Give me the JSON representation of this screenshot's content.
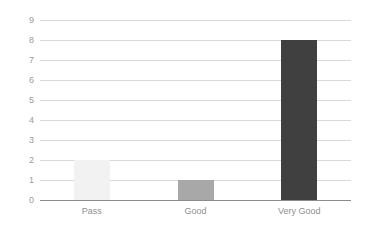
{
  "chart_data": {
    "type": "bar",
    "title": "",
    "subtitle": "",
    "xlabel": "",
    "ylabel": "",
    "categories": [
      "Pass",
      "Good",
      "Very Good"
    ],
    "values": [
      2,
      1,
      8
    ],
    "series": [
      {
        "name": "",
        "values": [
          2,
          1,
          8
        ]
      }
    ],
    "bar_colors": [
      "#f2f2f2",
      "#a8a8a8",
      "#404040"
    ],
    "ylim": [
      0,
      9
    ],
    "y_ticks": [
      0,
      1,
      2,
      3,
      4,
      5,
      6,
      7,
      8,
      9
    ],
    "y_tick_labels": [
      "0",
      "1",
      "2",
      "3",
      "4",
      "5",
      "6",
      "7",
      "8",
      "9"
    ],
    "grid": true,
    "grid_axis": "y",
    "legend": false,
    "legend_position": "none",
    "background_color": "#ffffff",
    "gridline_color": "#d9d9d9",
    "axis_line_color": "#8c8c8c",
    "tick_label_color": "#9a9a9a",
    "category_label_color": "#8f8f8f"
  },
  "axes": {
    "y_ticks": [
      {
        "label": "9",
        "value": 9
      },
      {
        "label": "8",
        "value": 8
      },
      {
        "label": "7",
        "value": 7
      },
      {
        "label": "6",
        "value": 6
      },
      {
        "label": "5",
        "value": 5
      },
      {
        "label": "4",
        "value": 4
      },
      {
        "label": "3",
        "value": 3
      },
      {
        "label": "2",
        "value": 2
      },
      {
        "label": "1",
        "value": 1
      },
      {
        "label": "0",
        "value": 0
      }
    ],
    "x_ticks": [
      {
        "label": "Pass"
      },
      {
        "label": "Good"
      },
      {
        "label": "Very Good"
      }
    ]
  },
  "bars": [
    {
      "category": "Pass",
      "value": 2,
      "color": "#f2f2f2"
    },
    {
      "category": "Good",
      "value": 1,
      "color": "#a8a8a8"
    },
    {
      "category": "Very Good",
      "value": 8,
      "color": "#404040"
    }
  ]
}
